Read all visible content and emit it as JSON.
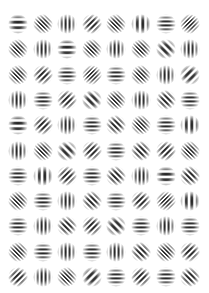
{
  "grid": {
    "columns": 8,
    "rows": 11,
    "origin_x": 18,
    "origin_y": 24,
    "step_x": 24.6,
    "step_y": 25.3,
    "patch_size": 20,
    "stripe_color": "#1a1a1a",
    "background_color": "#ffffff"
  },
  "legend": {
    "H": "horizontal stripes",
    "V": "vertical stripes",
    "D": "diagonal stripes rising (/)",
    "B": "diagonal stripes falling (\\)"
  },
  "patches": [
    [
      "H:c",
      "B:f",
      "V:m",
      "D:m",
      "B:f",
      "V:c",
      "H:m",
      "D:f"
    ],
    [
      "B:f",
      "V:m",
      "H:c",
      "B:f",
      "V:m",
      "B:f",
      "B:c",
      "V:m"
    ],
    [
      "B:f",
      "D:m",
      "H:m",
      "D:f",
      "H:m",
      "B:f",
      "V:m",
      "D:c"
    ],
    [
      "V:m",
      "H:m",
      "D:m",
      "B:c",
      "B:f",
      "V:m",
      "B:m",
      "H:m"
    ],
    [
      "H:c",
      "D:m",
      "V:m",
      "H:m",
      "B:m",
      "B:f",
      "H:m",
      "V:c"
    ],
    [
      "V:m",
      "B:f",
      "B:c",
      "D:m",
      "H:m",
      "B:m",
      "D:m",
      "B:f"
    ],
    [
      "H:m",
      "V:c",
      "D:m",
      "H:m",
      "B:m",
      "V:m",
      "H:c",
      "B:m"
    ],
    [
      "B:f",
      "H:m",
      "V:m",
      "B:m",
      "H:m",
      "D:m",
      "D:f",
      "V:c"
    ],
    [
      "H:m",
      "V:m",
      "B:m",
      "D:m",
      "B:c",
      "H:m",
      "V:m",
      "H:m"
    ],
    [
      "B:f",
      "H:m",
      "V:m",
      "H:m",
      "V:m",
      "B:m",
      "B:f",
      "D:m"
    ],
    [
      "D:m",
      "V:m",
      "B:f",
      "D:c",
      "H:m",
      "D:m",
      "H:m",
      "B:m"
    ]
  ]
}
